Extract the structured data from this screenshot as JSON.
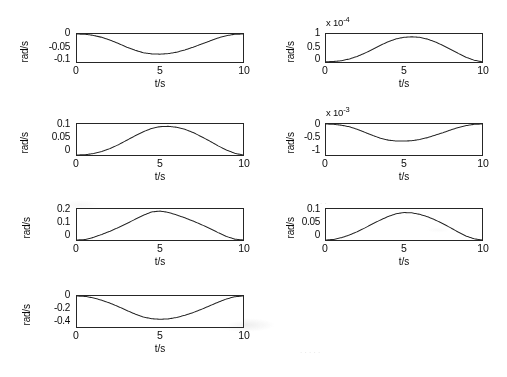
{
  "figure": {
    "title": "",
    "rows": 4,
    "cols": 2,
    "panel_count": 7,
    "line_color": "#2b2b2b",
    "axis_color": "#2b2b2b",
    "background": "#ffffff",
    "shared_xlabel": "t/s",
    "shared_ylabel": "rad/s",
    "xtick_labels": [
      "0",
      "5",
      "10"
    ]
  },
  "chart_data": [
    {
      "id": "panel-1",
      "position": "row1-left",
      "type": "line",
      "title": "",
      "xlabel": "t/s",
      "ylabel": "rad/s",
      "exponent_label": "",
      "xlim": [
        0,
        10
      ],
      "ylim": [
        -0.1,
        0
      ],
      "xticks": [
        0,
        5,
        10
      ],
      "xtick_labels": [
        "0",
        "5",
        "10"
      ],
      "yticks": [
        0,
        -0.05,
        -0.1
      ],
      "ytick_labels": [
        "0",
        "-0.05",
        "-0.1"
      ],
      "grid": false,
      "legend": "none",
      "x": [
        0,
        0.5,
        1,
        1.5,
        2,
        2.5,
        3,
        3.5,
        4,
        4.5,
        5,
        5.5,
        6,
        6.5,
        7,
        7.5,
        8,
        8.5,
        9,
        9.5,
        10
      ],
      "y": [
        0,
        -0.001,
        -0.005,
        -0.012,
        -0.022,
        -0.034,
        -0.047,
        -0.058,
        -0.067,
        -0.071,
        -0.072,
        -0.07,
        -0.065,
        -0.057,
        -0.047,
        -0.036,
        -0.025,
        -0.014,
        -0.006,
        -0.001,
        0
      ]
    },
    {
      "id": "panel-2",
      "position": "row1-right",
      "type": "line",
      "title": "",
      "xlabel": "t/s",
      "ylabel": "rad/s",
      "exponent_label": "x 10",
      "exponent_power": "-4",
      "xlim": [
        0,
        10
      ],
      "ylim": [
        0,
        1.1
      ],
      "xticks": [
        0,
        5,
        10
      ],
      "xtick_labels": [
        "0",
        "5",
        "10"
      ],
      "yticks": [
        0,
        0.5,
        1
      ],
      "ytick_labels": [
        "0",
        "0.5",
        "1"
      ],
      "grid": false,
      "legend": "none",
      "x": [
        0,
        0.5,
        1,
        1.5,
        2,
        2.5,
        3,
        3.5,
        4,
        4.5,
        5,
        5.5,
        6,
        6.5,
        7,
        7.5,
        8,
        8.5,
        9,
        9.5,
        10
      ],
      "y": [
        0.01,
        0.02,
        0.05,
        0.12,
        0.22,
        0.35,
        0.5,
        0.66,
        0.8,
        0.91,
        0.97,
        0.99,
        0.97,
        0.9,
        0.79,
        0.65,
        0.49,
        0.33,
        0.18,
        0.07,
        0.01
      ]
    },
    {
      "id": "panel-3",
      "position": "row2-left",
      "type": "line",
      "title": "",
      "xlabel": "t/s",
      "ylabel": "rad/s",
      "exponent_label": "",
      "xlim": [
        0,
        10
      ],
      "ylim": [
        0,
        0.105
      ],
      "xticks": [
        0,
        5,
        10
      ],
      "xtick_labels": [
        "0",
        "5",
        "10"
      ],
      "yticks": [
        0,
        0.05,
        0.1
      ],
      "ytick_labels": [
        "0",
        "0.05",
        "0.1"
      ],
      "grid": false,
      "legend": "none",
      "x": [
        0,
        0.5,
        1,
        1.5,
        2,
        2.5,
        3,
        3.5,
        4,
        4.5,
        5,
        5.5,
        6,
        6.5,
        7,
        7.5,
        8,
        8.5,
        9,
        9.5,
        10
      ],
      "y": [
        0.0,
        0.001,
        0.005,
        0.012,
        0.022,
        0.035,
        0.05,
        0.065,
        0.079,
        0.09,
        0.096,
        0.097,
        0.094,
        0.087,
        0.076,
        0.062,
        0.047,
        0.031,
        0.017,
        0.006,
        0.0
      ]
    },
    {
      "id": "panel-4",
      "position": "row2-right",
      "type": "line",
      "title": "",
      "xlabel": "t/s",
      "ylabel": "rad/s",
      "exponent_label": "x 10",
      "exponent_power": "-3",
      "xlim": [
        0,
        10
      ],
      "ylim": [
        -1,
        0
      ],
      "xticks": [
        0,
        5,
        10
      ],
      "xtick_labels": [
        "0",
        "5",
        "10"
      ],
      "yticks": [
        0,
        -0.5,
        -1
      ],
      "ytick_labels": [
        "0",
        "-0.5",
        "-1"
      ],
      "grid": false,
      "legend": "none",
      "x": [
        0,
        0.5,
        1,
        1.5,
        2,
        2.5,
        3,
        3.5,
        4,
        4.5,
        5,
        5.5,
        6,
        6.5,
        7,
        7.5,
        8,
        8.5,
        9,
        9.5,
        10
      ],
      "y": [
        0.0,
        -0.01,
        -0.04,
        -0.09,
        -0.17,
        -0.27,
        -0.37,
        -0.46,
        -0.52,
        -0.55,
        -0.55,
        -0.54,
        -0.5,
        -0.44,
        -0.36,
        -0.28,
        -0.19,
        -0.11,
        -0.05,
        -0.01,
        0.0
      ]
    },
    {
      "id": "panel-5",
      "position": "row3-left",
      "type": "line",
      "title": "",
      "xlabel": "t/s",
      "ylabel": "rad/s",
      "exponent_label": "",
      "xlim": [
        0,
        10
      ],
      "ylim": [
        0,
        0.21
      ],
      "xticks": [
        0,
        5,
        10
      ],
      "xtick_labels": [
        "0",
        "5",
        "10"
      ],
      "yticks": [
        0,
        0.1,
        0.2
      ],
      "ytick_labels": [
        "0",
        "0.1",
        "0.2"
      ],
      "grid": false,
      "legend": "none",
      "x": [
        0,
        0.5,
        1,
        1.5,
        2,
        2.5,
        3,
        3.5,
        4,
        4.5,
        5,
        5.5,
        6,
        6.5,
        7,
        7.5,
        8,
        8.5,
        9,
        9.5,
        10
      ],
      "y": [
        0.0,
        0.003,
        0.018,
        0.038,
        0.06,
        0.085,
        0.112,
        0.14,
        0.168,
        0.19,
        0.196,
        0.187,
        0.17,
        0.15,
        0.128,
        0.104,
        0.078,
        0.05,
        0.024,
        0.006,
        0.0
      ]
    },
    {
      "id": "panel-6",
      "position": "row3-right",
      "type": "line",
      "title": "",
      "xlabel": "t/s",
      "ylabel": "rad/s",
      "exponent_label": "",
      "xlim": [
        0,
        10
      ],
      "ylim": [
        0,
        0.105
      ],
      "xticks": [
        0,
        5,
        10
      ],
      "xtick_labels": [
        "0",
        "5",
        "10"
      ],
      "yticks": [
        0,
        0.05,
        0.1
      ],
      "ytick_labels": [
        "0",
        "0.05",
        "0.1"
      ],
      "grid": false,
      "legend": "none",
      "x": [
        0,
        0.5,
        1,
        1.5,
        2,
        2.5,
        3,
        3.5,
        4,
        4.5,
        5,
        5.5,
        6,
        6.5,
        7,
        7.5,
        8,
        8.5,
        9,
        9.5,
        10
      ],
      "y": [
        0.0,
        0.002,
        0.008,
        0.017,
        0.028,
        0.041,
        0.055,
        0.068,
        0.08,
        0.089,
        0.093,
        0.092,
        0.087,
        0.079,
        0.068,
        0.055,
        0.041,
        0.026,
        0.013,
        0.004,
        0.0
      ]
    },
    {
      "id": "panel-7",
      "position": "row4-left",
      "type": "line",
      "title": "",
      "xlabel": "t/s",
      "ylabel": "rad/s",
      "exponent_label": "",
      "xlim": [
        0,
        10
      ],
      "ylim": [
        -0.45,
        0
      ],
      "xticks": [
        0,
        5,
        10
      ],
      "xtick_labels": [
        "0",
        "5",
        "10"
      ],
      "yticks": [
        0,
        -0.2,
        -0.4
      ],
      "ytick_labels": [
        "0",
        "-0.2",
        "-0.4"
      ],
      "grid": false,
      "legend": "none",
      "x": [
        0,
        0.5,
        1,
        1.5,
        2,
        2.5,
        3,
        3.5,
        4,
        4.5,
        5,
        5.5,
        6,
        6.5,
        7,
        7.5,
        8,
        8.5,
        9,
        9.5,
        10
      ],
      "y": [
        0.0,
        -0.006,
        -0.028,
        -0.062,
        -0.105,
        -0.155,
        -0.21,
        -0.262,
        -0.305,
        -0.33,
        -0.338,
        -0.332,
        -0.312,
        -0.28,
        -0.24,
        -0.193,
        -0.142,
        -0.09,
        -0.043,
        -0.011,
        0.0
      ]
    }
  ],
  "panels": [
    {
      "ylabel": "rad/s",
      "xlabel": "t/s",
      "ytick_labels": [
        "0",
        "-0.05",
        "-0.1"
      ],
      "xtick_labels": [
        "0",
        "5",
        "10"
      ],
      "exponent_label": ""
    },
    {
      "ylabel": "rad/s",
      "xlabel": "t/s",
      "ytick_labels": [
        "1",
        "0.5",
        "0"
      ],
      "xtick_labels": [
        "0",
        "5",
        "10"
      ],
      "exponent_label": "x 10",
      "exponent_power": "-4"
    },
    {
      "ylabel": "rad/s",
      "xlabel": "t/s",
      "ytick_labels": [
        "0.1",
        "0.05",
        "0"
      ],
      "xtick_labels": [
        "0",
        "5",
        "10"
      ],
      "exponent_label": ""
    },
    {
      "ylabel": "rad/s",
      "xlabel": "t/s",
      "ytick_labels": [
        "0",
        "-0.5",
        "-1"
      ],
      "xtick_labels": [
        "0",
        "5",
        "10"
      ],
      "exponent_label": "x 10",
      "exponent_power": "-3"
    },
    {
      "ylabel": "rad/s",
      "xlabel": "t/s",
      "ytick_labels": [
        "0.2",
        "0.1",
        "0"
      ],
      "xtick_labels": [
        "0",
        "5",
        "10"
      ],
      "exponent_label": ""
    },
    {
      "ylabel": "rad/s",
      "xlabel": "t/s",
      "ytick_labels": [
        "0.1",
        "0.05",
        "0"
      ],
      "xtick_labels": [
        "0",
        "5",
        "10"
      ],
      "exponent_label": ""
    },
    {
      "ylabel": "rad/s",
      "xlabel": "t/s",
      "ytick_labels": [
        "0",
        "-0.2",
        "-0.4"
      ],
      "xtick_labels": [
        "0",
        "5",
        "10"
      ],
      "exponent_label": ""
    }
  ]
}
